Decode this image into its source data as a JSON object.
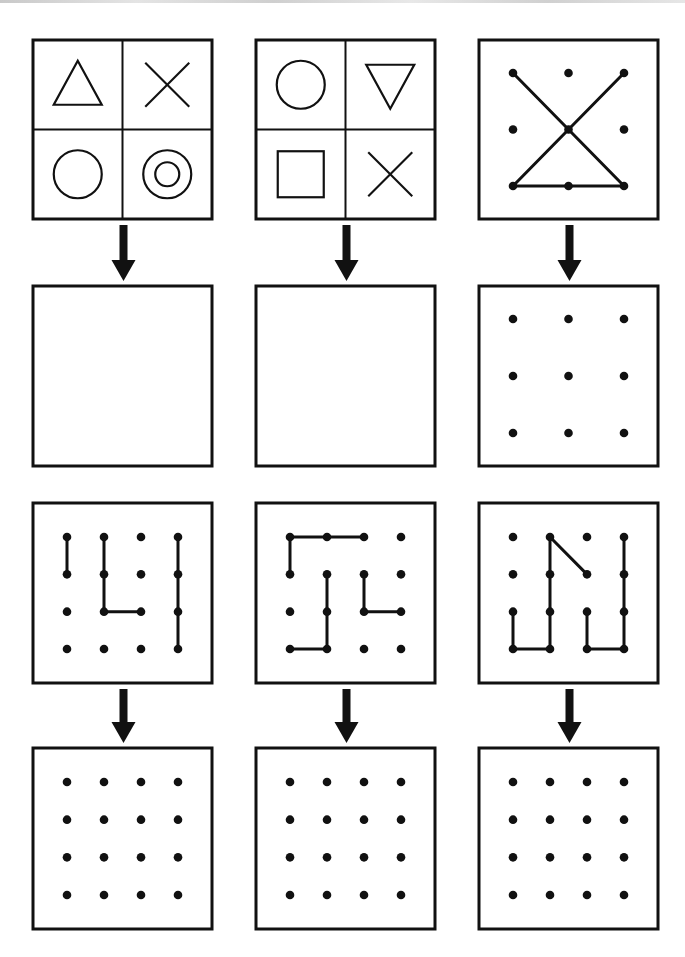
{
  "page": {
    "background": "#ffffff",
    "ink": "#111111",
    "border_width": 3,
    "line_width": 3
  },
  "columns_x": [
    33,
    256,
    479
  ],
  "box_width": 179,
  "rows": [
    {
      "name": "row-1-models",
      "y": 40,
      "h": 179,
      "panels": [
        {
          "name": "shapes-grid-panel-1",
          "kind": "quad",
          "cells": [
            "triangle-up",
            "x-cross",
            "circle",
            "double-circle"
          ]
        },
        {
          "name": "shapes-grid-panel-2",
          "kind": "quad",
          "cells": [
            "circle",
            "triangle-down",
            "square",
            "x-cross"
          ]
        },
        {
          "name": "dot-pattern-3x3-model",
          "kind": "dots",
          "grid": 3,
          "segments": [
            [
              [
                0,
                0
              ],
              [
                2,
                2
              ]
            ],
            [
              [
                2,
                0
              ],
              [
                0,
                2
              ]
            ],
            [
              [
                0,
                2
              ],
              [
                2,
                2
              ]
            ]
          ]
        }
      ]
    },
    {
      "name": "row-2-answers",
      "y": 286,
      "h": 180,
      "panels": [
        {
          "name": "answer-box-1",
          "kind": "blank"
        },
        {
          "name": "answer-box-2",
          "kind": "blank"
        },
        {
          "name": "answer-dot-grid-3x3",
          "kind": "dots",
          "grid": 3,
          "segments": []
        }
      ]
    },
    {
      "name": "row-3-models",
      "y": 503,
      "h": 180,
      "panels": [
        {
          "name": "dot-pattern-4x4-model-1",
          "kind": "dots",
          "grid": 4,
          "segments": [
            [
              [
                0,
                0
              ],
              [
                0,
                1
              ]
            ],
            [
              [
                1,
                0
              ],
              [
                1,
                2
              ]
            ],
            [
              [
                1,
                2
              ],
              [
                2,
                2
              ]
            ],
            [
              [
                3,
                0
              ],
              [
                3,
                3
              ]
            ]
          ]
        },
        {
          "name": "dot-pattern-4x4-model-2",
          "kind": "dots",
          "grid": 4,
          "segments": [
            [
              [
                0,
                1
              ],
              [
                0,
                0
              ]
            ],
            [
              [
                0,
                0
              ],
              [
                2,
                0
              ]
            ],
            [
              [
                1,
                1
              ],
              [
                1,
                3
              ]
            ],
            [
              [
                1,
                3
              ],
              [
                0,
                3
              ]
            ],
            [
              [
                2,
                1
              ],
              [
                2,
                2
              ]
            ],
            [
              [
                2,
                2
              ],
              [
                3,
                2
              ]
            ]
          ]
        },
        {
          "name": "dot-pattern-4x4-model-3",
          "kind": "dots",
          "grid": 4,
          "segments": [
            [
              [
                2,
                1
              ],
              [
                1,
                0
              ]
            ],
            [
              [
                1,
                0
              ],
              [
                1,
                3
              ]
            ],
            [
              [
                1,
                3
              ],
              [
                0,
                3
              ]
            ],
            [
              [
                0,
                3
              ],
              [
                0,
                2
              ]
            ],
            [
              [
                2,
                2
              ],
              [
                2,
                3
              ]
            ],
            [
              [
                2,
                3
              ],
              [
                3,
                3
              ]
            ],
            [
              [
                3,
                3
              ],
              [
                3,
                0
              ]
            ]
          ]
        }
      ]
    },
    {
      "name": "row-4-answers",
      "y": 748,
      "h": 181,
      "panels": [
        {
          "name": "answer-dot-grid-4x4-1",
          "kind": "dots",
          "grid": 4,
          "segments": []
        },
        {
          "name": "answer-dot-grid-4x4-2",
          "kind": "dots",
          "grid": 4,
          "segments": []
        },
        {
          "name": "answer-dot-grid-4x4-3",
          "kind": "dots",
          "grid": 4,
          "segments": []
        }
      ]
    }
  ],
  "arrows": [
    {
      "name": "arrow-down-icon",
      "from_row": 0,
      "to_row": 1,
      "label": "copy below"
    },
    {
      "name": "arrow-down-icon",
      "from_row": 2,
      "to_row": 3,
      "label": "copy below"
    }
  ]
}
